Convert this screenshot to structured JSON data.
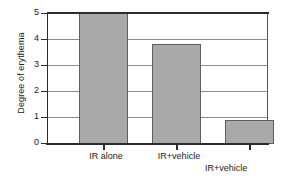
{
  "chart_data": {
    "type": "bar",
    "title": "",
    "xlabel": "",
    "ylabel": "Degree of erythema",
    "categories": [
      "IR alone",
      "IR+vehicle",
      "IR+vehicle\n+ antioxidant"
    ],
    "values": [
      5.0,
      3.8,
      0.93
    ],
    "ylim": [
      0,
      5
    ],
    "yticks": [
      0,
      1,
      2,
      3,
      4,
      5
    ],
    "ytick_labels": [
      "0",
      "1",
      "2",
      "3",
      "4",
      "5"
    ],
    "grid": true,
    "grid_axis": "y",
    "legend": false,
    "bar_color": "#a9a9a9",
    "bar_edge_color": "#5d5d5d",
    "axis_color": "#2b2b2b",
    "gridline_color": "#8d8d8d",
    "background": "#ffffff"
  },
  "axes": {
    "y_title": "Degree of erythema",
    "tick_0": "0",
    "tick_1": "1",
    "tick_2": "2",
    "tick_3": "3",
    "tick_4": "4",
    "tick_5": "5"
  },
  "x_labels": {
    "cat_0": "IR alone",
    "cat_1": "IR+vehicle",
    "cat_2_line1": "IR+vehicle",
    "cat_2_line2": "+ antioxidant"
  }
}
